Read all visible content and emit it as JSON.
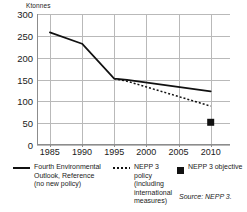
{
  "chart_data": {
    "type": "line",
    "title": "",
    "xlabel": "",
    "ylabel": "Ktonnes",
    "unit_label": "Ktonnes",
    "xlim": [
      1983,
      2013
    ],
    "ylim": [
      0,
      300
    ],
    "grid": true,
    "legend_position": "bottom",
    "x_ticks": [
      "1985",
      "1990",
      "1995",
      "2000",
      "2005",
      "2010"
    ],
    "x_tick_values": [
      1985,
      1990,
      1995,
      2000,
      2005,
      2010
    ],
    "y_ticks": [
      "0",
      "50",
      "100",
      "150",
      "200",
      "250",
      "300"
    ],
    "y_tick_values": [
      0,
      50,
      100,
      150,
      200,
      250,
      300
    ],
    "series": [
      {
        "name": "Fourth Environmental Outlook, Reference (no new policy)",
        "style": "solid",
        "color": "#111111",
        "x": [
          1985,
          1990,
          1995,
          1997,
          2010
        ],
        "values": [
          258,
          232,
          152,
          149,
          123
        ]
      },
      {
        "name": "NEPP 3 policy (including international measures)",
        "style": "dotted",
        "color": "#111111",
        "x": [
          1995,
          1997,
          2000,
          2005,
          2010
        ],
        "values": [
          152,
          146,
          133,
          111,
          89
        ]
      },
      {
        "name": "NEPP 3 objective",
        "style": "marker-square",
        "color": "#111111",
        "x": [
          2010
        ],
        "values": [
          52
        ]
      }
    ],
    "annotations": [
      {
        "name": "source",
        "text": "Source: NEPP 3."
      }
    ]
  },
  "legend": {
    "entries": [
      {
        "glyph": "solid-line-glyph",
        "label": "Fourth Environmental\nOutlook, Reference\n(no new policy)"
      },
      {
        "glyph": "dotted-line-glyph",
        "label": "NEPP 3 policy\n(including\ninternational\nmeasures)"
      },
      {
        "glyph": "filled-square-glyph",
        "label": "NEPP 3 objective"
      }
    ]
  },
  "source": {
    "text": "Source: NEPP 3."
  },
  "colors": {
    "series": "#111111",
    "grid": "#b9b9b9",
    "axis": "#8c8c8c",
    "text": "#1a1a1a",
    "background": "#ffffff"
  }
}
